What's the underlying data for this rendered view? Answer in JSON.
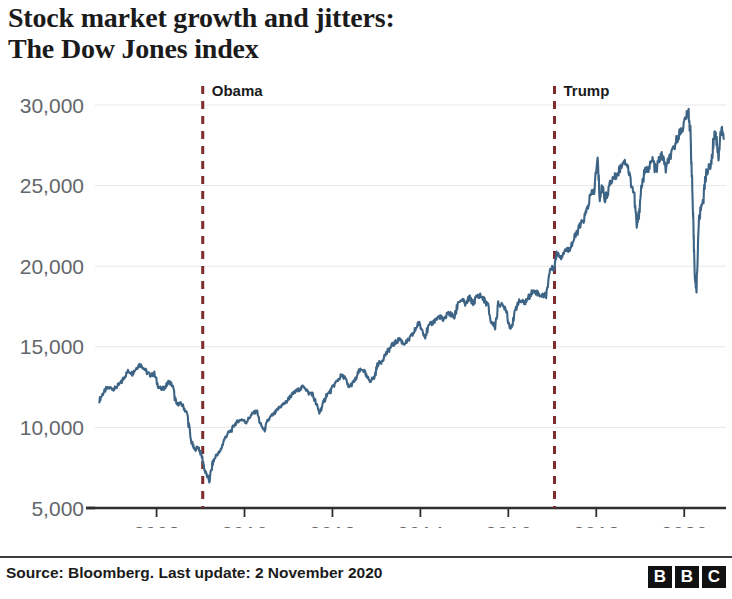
{
  "title": {
    "line1": "Stock market growth and jitters:",
    "line2": "The Dow Jones index"
  },
  "footer": {
    "source": "Source: Bloomberg. Last update: 2 November 2020",
    "logo": [
      "B",
      "B",
      "C"
    ]
  },
  "colors": {
    "line": "#3d6485",
    "event_line": "#7d2b2b",
    "axis": "#2f2f32",
    "grid": "#e7e7ea",
    "tick_text": "#63666a",
    "title_text": "#1b1b1b"
  },
  "chart_data": {
    "type": "line",
    "title": "Stock market growth and jitters: The Dow Jones index",
    "xlabel": "",
    "ylabel": "",
    "xlim": [
      2006.6,
      2020.95
    ],
    "ylim": [
      5000,
      30000
    ],
    "grid": true,
    "legend": "none",
    "ytick_labels": [
      "30,000",
      "25,000",
      "20,000",
      "15,000",
      "10,000",
      "5,000"
    ],
    "ytick_values": [
      30000,
      25000,
      20000,
      15000,
      10000,
      5000
    ],
    "xtick_labels": [
      "2008",
      "2010",
      "2012",
      "2014",
      "2016",
      "2018",
      "2020"
    ],
    "xtick_values": [
      2008,
      2010,
      2012,
      2014,
      2016,
      2018,
      2020
    ],
    "annotations": [
      {
        "label": "Obama",
        "x": 2009.05,
        "type": "vertical-dashed"
      },
      {
        "label": "Trump",
        "x": 2017.05,
        "type": "vertical-dashed"
      }
    ],
    "series": [
      {
        "name": "Dow Jones Industrial Average",
        "color": "#3d6485",
        "x": [
          2006.7,
          2006.78,
          2006.86,
          2006.95,
          2007.03,
          2007.11,
          2007.2,
          2007.28,
          2007.36,
          2007.45,
          2007.53,
          2007.61,
          2007.7,
          2007.78,
          2007.86,
          2007.95,
          2008.03,
          2008.11,
          2008.2,
          2008.28,
          2008.36,
          2008.45,
          2008.53,
          2008.61,
          2008.7,
          2008.78,
          2008.86,
          2008.95,
          2009.03,
          2009.11,
          2009.2,
          2009.28,
          2009.36,
          2009.45,
          2009.53,
          2009.61,
          2009.7,
          2009.78,
          2009.86,
          2009.95,
          2010.03,
          2010.11,
          2010.2,
          2010.28,
          2010.36,
          2010.45,
          2010.53,
          2010.61,
          2010.7,
          2010.78,
          2010.86,
          2010.95,
          2011.03,
          2011.11,
          2011.2,
          2011.28,
          2011.36,
          2011.45,
          2011.53,
          2011.61,
          2011.7,
          2011.78,
          2011.86,
          2011.95,
          2012.03,
          2012.11,
          2012.2,
          2012.28,
          2012.36,
          2012.45,
          2012.53,
          2012.61,
          2012.7,
          2012.78,
          2012.86,
          2012.95,
          2013.03,
          2013.11,
          2013.2,
          2013.28,
          2013.36,
          2013.45,
          2013.53,
          2013.61,
          2013.7,
          2013.78,
          2013.86,
          2013.95,
          2014.03,
          2014.11,
          2014.2,
          2014.28,
          2014.36,
          2014.45,
          2014.53,
          2014.61,
          2014.7,
          2014.78,
          2014.86,
          2014.95,
          2015.03,
          2015.11,
          2015.2,
          2015.28,
          2015.36,
          2015.45,
          2015.53,
          2015.61,
          2015.7,
          2015.78,
          2015.86,
          2015.95,
          2016.03,
          2016.11,
          2016.2,
          2016.28,
          2016.36,
          2016.45,
          2016.53,
          2016.61,
          2016.7,
          2016.78,
          2016.86,
          2016.95,
          2017.03,
          2017.11,
          2017.2,
          2017.28,
          2017.36,
          2017.45,
          2017.53,
          2017.61,
          2017.7,
          2017.78,
          2017.86,
          2017.95,
          2018.03,
          2018.08,
          2018.14,
          2018.2,
          2018.28,
          2018.36,
          2018.45,
          2018.53,
          2018.61,
          2018.7,
          2018.78,
          2018.86,
          2018.92,
          2018.97,
          2019.03,
          2019.11,
          2019.2,
          2019.28,
          2019.36,
          2019.42,
          2019.5,
          2019.58,
          2019.66,
          2019.74,
          2019.82,
          2019.9,
          2019.97,
          2020.04,
          2020.1,
          2020.14,
          2020.17,
          2020.2,
          2020.22,
          2020.25,
          2020.28,
          2020.33,
          2020.38,
          2020.44,
          2020.5,
          2020.56,
          2020.62,
          2020.67,
          2020.7,
          2020.74,
          2020.78,
          2020.82,
          2020.86,
          2020.9
        ],
        "y": [
          11700,
          12100,
          12400,
          12460,
          12380,
          12550,
          12800,
          13200,
          13500,
          13350,
          13650,
          13900,
          13750,
          13400,
          13250,
          13300,
          12600,
          12350,
          12500,
          12850,
          12600,
          11400,
          11500,
          11300,
          10800,
          9200,
          8600,
          8800,
          8200,
          7200,
          6700,
          7800,
          8300,
          8500,
          9200,
          9600,
          9800,
          10200,
          10400,
          10500,
          10300,
          10600,
          10900,
          11000,
          10200,
          9800,
          10400,
          10700,
          10900,
          11200,
          11400,
          11570,
          11900,
          12100,
          12300,
          12400,
          12600,
          12100,
          12150,
          11600,
          10900,
          11400,
          12000,
          12220,
          12600,
          12900,
          13200,
          13100,
          12500,
          12700,
          13000,
          13500,
          13600,
          13100,
          12900,
          13100,
          13900,
          14100,
          14500,
          14800,
          15100,
          15300,
          15500,
          15200,
          15300,
          15600,
          15900,
          16500,
          16100,
          15700,
          16300,
          16500,
          16700,
          16900,
          16550,
          17100,
          17000,
          16800,
          17800,
          17900,
          17600,
          18050,
          17700,
          18100,
          18200,
          17900,
          17600,
          16500,
          16300,
          17700,
          17550,
          17400,
          16200,
          16500,
          17700,
          17850,
          17700,
          18000,
          18400,
          18450,
          18250,
          18150,
          18300,
          19800,
          19900,
          20800,
          20600,
          21000,
          21000,
          21400,
          21900,
          22400,
          22800,
          23400,
          24300,
          24700,
          26600,
          24200,
          25000,
          24100,
          24800,
          25400,
          25600,
          26000,
          26500,
          26400,
          25300,
          24500,
          22400,
          23300,
          25000,
          25900,
          26100,
          26600,
          25800,
          26600,
          26900,
          26000,
          26700,
          27100,
          27800,
          28300,
          28600,
          29300,
          29500,
          28300,
          26000,
          23200,
          21200,
          19000,
          18600,
          22700,
          23600,
          24300,
          25800,
          26100,
          26400,
          27900,
          28300,
          27700,
          26800,
          28200,
          28400,
          27900
        ]
      }
    ]
  }
}
